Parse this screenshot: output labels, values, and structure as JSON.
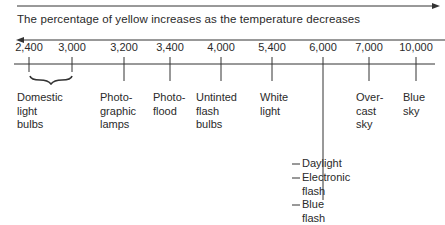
{
  "diagram": {
    "top_arrow_direction": "right",
    "caption": "The percentage of yellow increases as the temperature decreases",
    "caption_arrow_direction": "left",
    "scale_unit": "color temperature (K)",
    "ticks": [
      {
        "value": "2,400"
      },
      {
        "value": "3,000"
      },
      {
        "value": "3,200"
      },
      {
        "value": "3,400"
      },
      {
        "value": "4,000"
      },
      {
        "value": "5,400"
      },
      {
        "value": "6,000"
      },
      {
        "value": "7,000"
      },
      {
        "value": "10,000"
      }
    ],
    "sources": [
      {
        "label": "Domestic\nlight\nbulbs",
        "range": [
          "2,400",
          "3,000"
        ]
      },
      {
        "label": "Photo-\ngraphic\nlamps",
        "at": "3,200"
      },
      {
        "label": "Photo-\nflood",
        "at": "3,400"
      },
      {
        "label": "Untinted\nflash\nbulbs",
        "at": "4,000"
      },
      {
        "label": "White\nlight",
        "at": "5,400"
      },
      {
        "label": "Over-\ncast\nsky",
        "at": "7,000"
      },
      {
        "label": "Blue\nsky",
        "at": "10,000"
      }
    ],
    "stacked_sources_at_6000": [
      {
        "label": "Daylight"
      },
      {
        "label": "Electronic\nflash"
      },
      {
        "label": "Blue\nflash"
      }
    ]
  }
}
